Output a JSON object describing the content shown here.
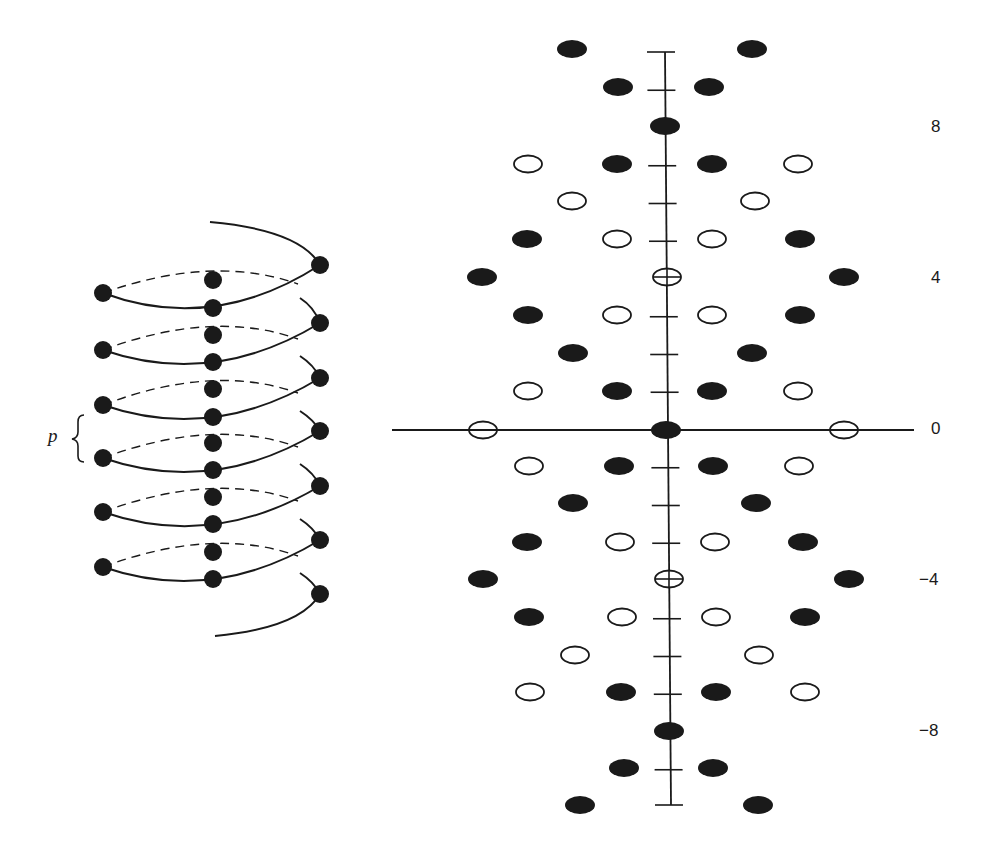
{
  "helix": {
    "pitch_label": "p",
    "left_dots_y": [
      293,
      350,
      405,
      458,
      512,
      567
    ],
    "center_dots_y": [
      280,
      308,
      335,
      362,
      389,
      417,
      443,
      470,
      497,
      524,
      552,
      579
    ],
    "right_dots_y": [
      265,
      323,
      378,
      431,
      486,
      540,
      594
    ],
    "left_x": 103,
    "center_x": 213,
    "right_x": 320
  },
  "diffraction": {
    "axis_labels": [
      {
        "text": "8",
        "level": 8
      },
      {
        "text": "4",
        "level": 4
      },
      {
        "text": "0",
        "level": 0
      },
      {
        "text": "−4",
        "level": -4
      },
      {
        "text": "−8",
        "level": -8
      }
    ],
    "levels": [
      {
        "level": 10,
        "y": 49,
        "spots": [
          {
            "x": 572,
            "t": "filled"
          },
          {
            "x": 752,
            "t": "filled"
          }
        ]
      },
      {
        "level": 9,
        "y": 87,
        "spots": [
          {
            "x": 618,
            "t": "filled"
          },
          {
            "x": 709,
            "t": "filled"
          }
        ]
      },
      {
        "level": 8,
        "y": 126,
        "spots": [
          {
            "x": 665,
            "t": "filled"
          }
        ]
      },
      {
        "level": 7,
        "y": 164,
        "spots": [
          {
            "x": 528,
            "t": "open"
          },
          {
            "x": 617,
            "t": "filled"
          },
          {
            "x": 712,
            "t": "filled"
          },
          {
            "x": 798,
            "t": "open"
          }
        ]
      },
      {
        "level": 6,
        "y": 201,
        "spots": [
          {
            "x": 572,
            "t": "open"
          },
          {
            "x": 755,
            "t": "open"
          }
        ]
      },
      {
        "level": 5,
        "y": 239,
        "spots": [
          {
            "x": 527,
            "t": "filled"
          },
          {
            "x": 617,
            "t": "open"
          },
          {
            "x": 712,
            "t": "open"
          },
          {
            "x": 800,
            "t": "filled"
          }
        ]
      },
      {
        "level": 4,
        "y": 277,
        "spots": [
          {
            "x": 482,
            "t": "filled"
          },
          {
            "x": 667,
            "t": "cross"
          },
          {
            "x": 844,
            "t": "filled"
          }
        ]
      },
      {
        "level": 3,
        "y": 315,
        "spots": [
          {
            "x": 528,
            "t": "filled"
          },
          {
            "x": 617,
            "t": "open"
          },
          {
            "x": 712,
            "t": "open"
          },
          {
            "x": 800,
            "t": "filled"
          }
        ]
      },
      {
        "level": 2,
        "y": 353,
        "spots": [
          {
            "x": 573,
            "t": "filled"
          },
          {
            "x": 752,
            "t": "filled"
          }
        ]
      },
      {
        "level": 1,
        "y": 391,
        "spots": [
          {
            "x": 528,
            "t": "open"
          },
          {
            "x": 617,
            "t": "filled"
          },
          {
            "x": 712,
            "t": "filled"
          },
          {
            "x": 798,
            "t": "open"
          }
        ]
      },
      {
        "level": 0,
        "y": 430,
        "spots": [
          {
            "x": 483,
            "t": "open"
          },
          {
            "x": 666,
            "t": "filled"
          },
          {
            "x": 844,
            "t": "open"
          }
        ]
      },
      {
        "level": -1,
        "y": 466,
        "spots": [
          {
            "x": 529,
            "t": "open"
          },
          {
            "x": 619,
            "t": "filled"
          },
          {
            "x": 713,
            "t": "filled"
          },
          {
            "x": 799,
            "t": "open"
          }
        ]
      },
      {
        "level": -2,
        "y": 503,
        "spots": [
          {
            "x": 573,
            "t": "filled"
          },
          {
            "x": 756,
            "t": "filled"
          }
        ]
      },
      {
        "level": -3,
        "y": 542,
        "spots": [
          {
            "x": 527,
            "t": "filled"
          },
          {
            "x": 620,
            "t": "open"
          },
          {
            "x": 715,
            "t": "open"
          },
          {
            "x": 803,
            "t": "filled"
          }
        ]
      },
      {
        "level": -4,
        "y": 579,
        "spots": [
          {
            "x": 483,
            "t": "filled"
          },
          {
            "x": 669,
            "t": "cross"
          },
          {
            "x": 849,
            "t": "filled"
          }
        ]
      },
      {
        "level": -5,
        "y": 617,
        "spots": [
          {
            "x": 529,
            "t": "filled"
          },
          {
            "x": 622,
            "t": "open"
          },
          {
            "x": 716,
            "t": "open"
          },
          {
            "x": 805,
            "t": "filled"
          }
        ]
      },
      {
        "level": -6,
        "y": 655,
        "spots": [
          {
            "x": 575,
            "t": "open"
          },
          {
            "x": 759,
            "t": "open"
          }
        ]
      },
      {
        "level": -7,
        "y": 692,
        "spots": [
          {
            "x": 530,
            "t": "open"
          },
          {
            "x": 621,
            "t": "filled"
          },
          {
            "x": 716,
            "t": "filled"
          },
          {
            "x": 805,
            "t": "open"
          }
        ]
      },
      {
        "level": -8,
        "y": 731,
        "spots": [
          {
            "x": 669,
            "t": "filled"
          }
        ]
      },
      {
        "level": -9,
        "y": 768,
        "spots": [
          {
            "x": 624,
            "t": "filled"
          },
          {
            "x": 713,
            "t": "filled"
          }
        ]
      },
      {
        "level": -10,
        "y": 805,
        "spots": [
          {
            "x": 580,
            "t": "filled"
          },
          {
            "x": 758,
            "t": "filled"
          }
        ]
      }
    ],
    "tick_levels": [
      10,
      9,
      7,
      6,
      5,
      3,
      2,
      1,
      -1,
      -2,
      -3,
      -5,
      -6,
      -7,
      -9,
      -10
    ],
    "colors": {
      "ink": "#1a1a1a",
      "background": "#ffffff"
    }
  }
}
